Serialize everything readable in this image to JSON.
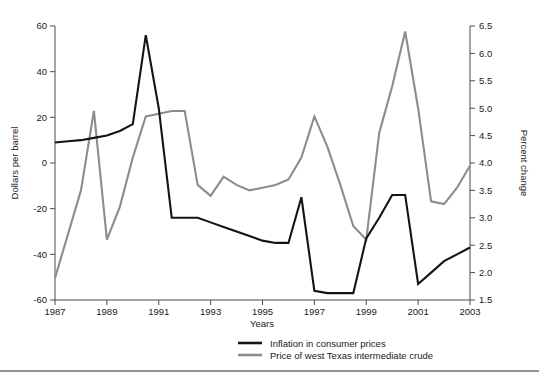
{
  "figure": {
    "cut_off_header": "",
    "background": "#ffffff"
  },
  "axes": {
    "left": {
      "title": "Dollars per barrel",
      "ticks": [
        "60",
        "40",
        "20",
        "0",
        "-20",
        "-40",
        "-60"
      ],
      "min": -60,
      "max": 60
    },
    "right": {
      "title": "Percent change",
      "ticks": [
        "6.5",
        "6.0",
        "5.5",
        "5.0",
        "4.5",
        "4.0",
        "3.5",
        "3.0",
        "2.5",
        "2.0",
        "1.5"
      ],
      "min": 1.5,
      "max": 6.5
    },
    "bottom": {
      "title": "Years",
      "ticks": [
        "1987",
        "1989",
        "1991",
        "1993",
        "1995",
        "1997",
        "1999",
        "2001",
        "2003"
      ],
      "min": 1987,
      "max": 2003
    }
  },
  "legend": {
    "items": [
      {
        "label": "Inflation in consumer prices",
        "color": "#141414"
      },
      {
        "label": "Price of west Texas intermediate crude",
        "color": "#8c8c8c"
      }
    ]
  },
  "chart_data": {
    "type": "line",
    "title": "",
    "xlabel": "Years",
    "ylabel": "Dollars per barrel",
    "y2label": "Percent change",
    "xlim": [
      1987,
      2003
    ],
    "ylim": [
      -60,
      60
    ],
    "y2lim": [
      1.5,
      6.5
    ],
    "grid": false,
    "legend_position": "bottom-center",
    "x": [
      1987,
      1987.5,
      1988,
      1988.5,
      1989,
      1989.5,
      1990,
      1990.5,
      1991,
      1991.5,
      1992,
      1992.5,
      1993,
      1993.5,
      1994,
      1994.5,
      1995,
      1995.5,
      1996,
      1996.5,
      1997,
      1997.5,
      1998,
      1998.5,
      1999,
      1999.5,
      2000,
      2000.5,
      2001,
      2001.5,
      2002,
      2002.5,
      2003
    ],
    "series": [
      {
        "name": "Inflation in consumer prices",
        "axis": "left",
        "units": "Dollars per barrel",
        "color": "#141414",
        "values": [
          9,
          9.5,
          10,
          11,
          12,
          14,
          17,
          56,
          24,
          -24,
          -24,
          -24,
          -26,
          -28,
          -30,
          -32,
          -34,
          -35,
          -35,
          -15,
          -56,
          -57,
          -57,
          -57,
          -33,
          -24,
          -14,
          -14,
          -53,
          -48,
          -43,
          -40,
          -37
        ]
      },
      {
        "name": "Price of west Texas intermediate crude",
        "axis": "right",
        "units": "Percent change",
        "color": "#8c8c8c",
        "values": [
          1.9,
          2.7,
          3.5,
          4.95,
          2.6,
          3.2,
          4.1,
          4.85,
          4.9,
          4.95,
          4.95,
          3.6,
          3.4,
          3.75,
          3.6,
          3.5,
          3.55,
          3.6,
          3.7,
          4.1,
          4.85,
          4.3,
          3.6,
          2.85,
          2.6,
          4.55,
          5.4,
          6.4,
          5.0,
          3.3,
          3.25,
          3.55,
          3.95
        ]
      }
    ]
  }
}
